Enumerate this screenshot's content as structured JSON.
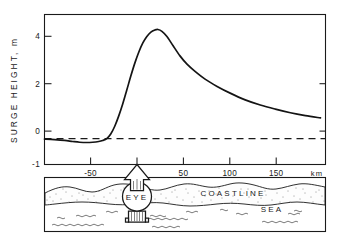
{
  "chart_data": {
    "type": "line",
    "title": "",
    "xlabel": "",
    "ylabel": "SURGE HEIGHT, m",
    "xunit": "km",
    "xlim": [
      -90,
      190
    ],
    "ylim": [
      -1,
      4.8
    ],
    "grid": false,
    "legend": null,
    "x_ticks": [
      -50,
      0,
      50,
      100,
      150
    ],
    "x_tick_labels": [
      "-50",
      "",
      "50",
      "100",
      "150"
    ],
    "y_ticks": [
      -1,
      0,
      2,
      4
    ],
    "y_tick_labels": [
      "-1",
      "0",
      "2",
      "4"
    ],
    "series": [
      {
        "name": "Surge height profile",
        "style": "solid",
        "x": [
          -90,
          -80,
          -70,
          -62,
          -55,
          -48,
          -42,
          -36,
          -32,
          -28,
          -24,
          -20,
          -16,
          -12,
          -8,
          -4,
          0,
          4,
          8,
          12,
          16,
          20,
          23,
          27,
          32,
          38,
          45,
          52,
          60,
          70,
          82,
          95,
          110,
          125,
          140,
          155,
          170,
          185
        ],
        "y": [
          -0.02,
          -0.04,
          -0.07,
          -0.11,
          -0.14,
          -0.15,
          -0.14,
          -0.11,
          -0.07,
          0.0,
          0.18,
          0.48,
          0.88,
          1.35,
          1.88,
          2.42,
          2.92,
          3.35,
          3.7,
          3.95,
          4.12,
          4.2,
          4.22,
          4.15,
          3.95,
          3.6,
          3.2,
          2.88,
          2.6,
          2.3,
          2.02,
          1.76,
          1.5,
          1.3,
          1.14,
          1.0,
          0.89,
          0.8
        ]
      },
      {
        "name": "Zero reference (still water level)",
        "style": "dashed",
        "x": [
          -90,
          190
        ],
        "y": [
          0,
          0
        ]
      }
    ],
    "annotations": [
      {
        "label": "peak surge",
        "x": 23,
        "y": 4.2
      },
      {
        "label": "setdown minimum",
        "x": -48,
        "y": -0.15
      }
    ]
  },
  "diagram": {
    "eye_label": "EYE",
    "coastline_label": "COASTLINE",
    "sea_label": "SEA",
    "eye_position_km": 0,
    "arrow_direction": "up"
  },
  "colors": {
    "ink": "#1a1a1a",
    "curve": "#141414",
    "background": "#ffffff"
  }
}
